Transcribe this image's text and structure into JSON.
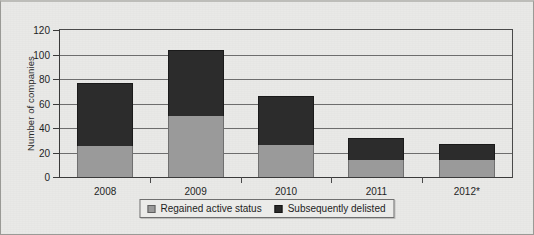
{
  "chart_data": {
    "type": "bar",
    "subtype": "stacked-bar",
    "title": "",
    "xlabel": "",
    "ylabel": "Number of companies",
    "ylim": [
      0,
      120
    ],
    "ytick_step": 20,
    "yticks": [
      0,
      20,
      40,
      60,
      80,
      100,
      120
    ],
    "grid": true,
    "grid_axis": "y",
    "legend_position": "bottom-center",
    "categories": [
      "2008",
      "2009",
      "2010",
      "2011",
      "2012*"
    ],
    "series": [
      {
        "name": "Regained active status",
        "color": "#9a9a9a",
        "values": [
          25,
          50,
          26,
          14,
          14
        ]
      },
      {
        "name": "Subsequently delisted",
        "color": "#2c2c2c",
        "values": [
          52,
          54,
          40,
          18,
          13
        ]
      }
    ],
    "totals": [
      77,
      104,
      66,
      32,
      27
    ],
    "note": "2012 values marked with an asterisk"
  },
  "legend": {
    "items": [
      {
        "label": "Regained active status",
        "swatch": "light"
      },
      {
        "label": "Subsequently delisted",
        "swatch": "dark"
      }
    ]
  }
}
